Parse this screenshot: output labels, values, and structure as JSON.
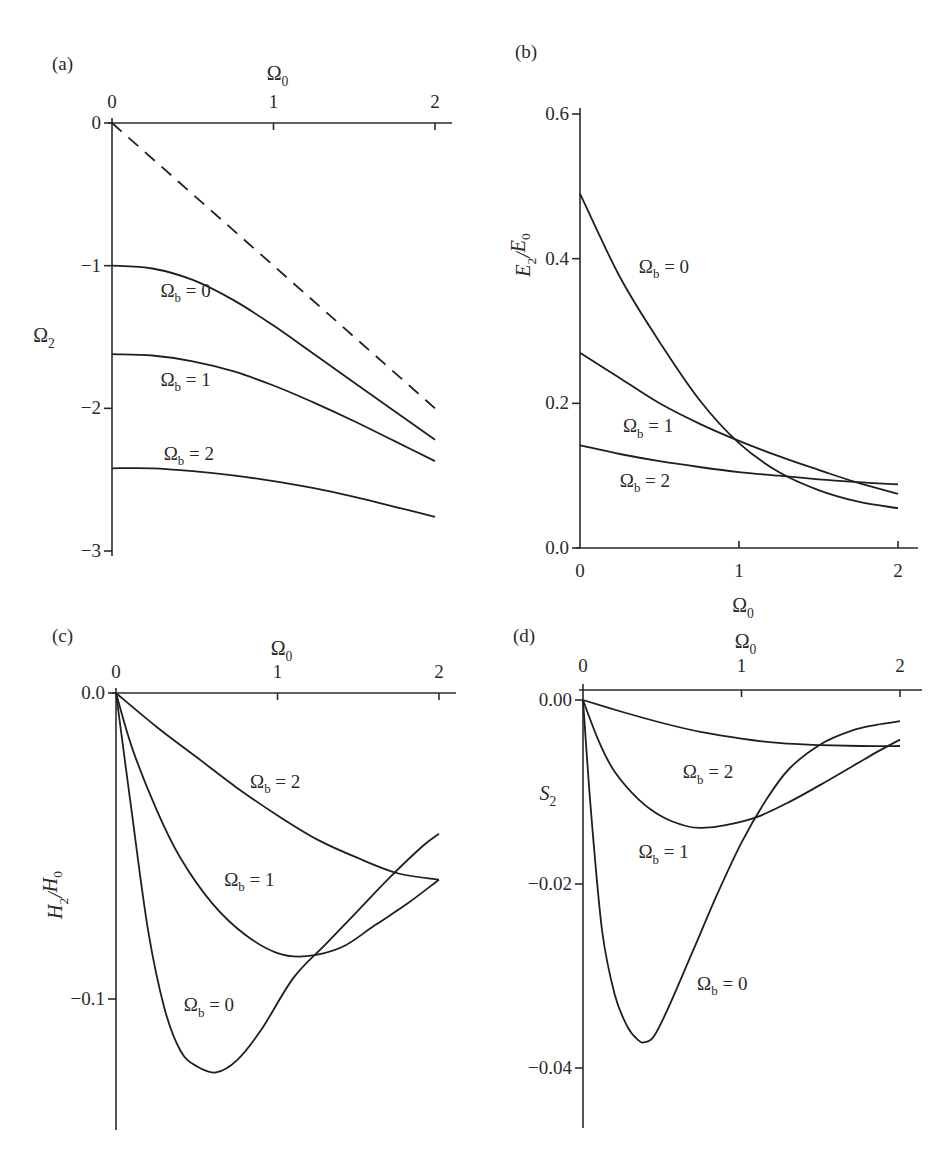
{
  "chart_data": [
    {
      "panel": "(a)",
      "type": "line",
      "xlabel": "Ω0",
      "xlabel_position": "top",
      "ylabel": "Ω2",
      "xlim": [
        0,
        2.1
      ],
      "ylim": [
        -3,
        0
      ],
      "xticks": [
        0,
        1,
        2
      ],
      "xtick_labels": [
        "0",
        "1",
        "2"
      ],
      "yticks": [
        0,
        -1,
        -2,
        -3
      ],
      "ytick_labels": [
        "0",
        "−1",
        "−2",
        "−3"
      ],
      "grid": false,
      "series": [
        {
          "name": "dashed reference",
          "style": "dashed",
          "x": [
            0,
            2
          ],
          "y": [
            0,
            -2
          ]
        },
        {
          "name": "Ωb = 0",
          "label": "Ωb = 0",
          "label_at": [
            0.3,
            -1.22
          ],
          "x": [
            0,
            0.25,
            0.5,
            0.75,
            1.0,
            1.25,
            1.5,
            1.75,
            2.0
          ],
          "y": [
            -1.0,
            -1.02,
            -1.1,
            -1.24,
            -1.42,
            -1.62,
            -1.82,
            -2.02,
            -2.22
          ]
        },
        {
          "name": "Ωb = 1",
          "label": "Ωb = 1",
          "label_at": [
            0.3,
            -1.84
          ],
          "x": [
            0,
            0.25,
            0.5,
            0.75,
            1.0,
            1.25,
            1.5,
            1.75,
            2.0
          ],
          "y": [
            -1.62,
            -1.63,
            -1.67,
            -1.74,
            -1.84,
            -1.96,
            -2.09,
            -2.23,
            -2.37
          ]
        },
        {
          "name": "Ωb = 2",
          "label": "Ωb = 2",
          "label_at": [
            0.32,
            -2.36
          ],
          "x": [
            0,
            0.25,
            0.5,
            0.75,
            1.0,
            1.25,
            1.5,
            1.75,
            2.0
          ],
          "y": [
            -2.42,
            -2.42,
            -2.44,
            -2.47,
            -2.51,
            -2.56,
            -2.62,
            -2.69,
            -2.76
          ]
        }
      ]
    },
    {
      "panel": "(b)",
      "type": "line",
      "xlabel": "Ω0",
      "xlabel_position": "bottom",
      "ylabel": "E2/E0",
      "xlim": [
        0,
        2.1
      ],
      "ylim": [
        0,
        0.6
      ],
      "xticks": [
        0,
        1,
        2
      ],
      "xtick_labels": [
        "0",
        "1",
        "2"
      ],
      "yticks": [
        0.0,
        0.2,
        0.4,
        0.6
      ],
      "ytick_labels": [
        "0.0",
        "0.2",
        "0.4",
        "0.6"
      ],
      "grid": false,
      "series": [
        {
          "name": "Ωb = 0",
          "label": "Ωb = 0",
          "label_at": [
            0.37,
            0.38
          ],
          "x": [
            0,
            0.25,
            0.5,
            0.75,
            1.0,
            1.25,
            1.5,
            1.75,
            2.0
          ],
          "y": [
            0.49,
            0.375,
            0.285,
            0.205,
            0.145,
            0.105,
            0.08,
            0.064,
            0.055
          ]
        },
        {
          "name": "Ωb = 1",
          "label": "Ωb = 1",
          "label_at": [
            0.27,
            0.16
          ],
          "x": [
            0,
            0.25,
            0.5,
            0.75,
            1.0,
            1.25,
            1.5,
            1.75,
            2.0
          ],
          "y": [
            0.27,
            0.235,
            0.2,
            0.172,
            0.148,
            0.127,
            0.108,
            0.09,
            0.075
          ]
        },
        {
          "name": "Ωb = 2",
          "label": "Ωb = 2",
          "label_at": [
            0.25,
            0.085
          ],
          "x": [
            0,
            0.25,
            0.5,
            0.75,
            1.0,
            1.25,
            1.5,
            1.75,
            2.0
          ],
          "y": [
            0.142,
            0.13,
            0.12,
            0.112,
            0.105,
            0.1,
            0.095,
            0.091,
            0.088
          ]
        }
      ]
    },
    {
      "panel": "(c)",
      "type": "line",
      "xlabel": "Ω0",
      "xlabel_position": "top",
      "ylabel": "H2/H0",
      "xlim": [
        0,
        2.1
      ],
      "ylim": [
        -0.142,
        0
      ],
      "xticks": [
        0,
        1,
        2
      ],
      "xtick_labels": [
        "0",
        "1",
        "2"
      ],
      "yticks": [
        0.0,
        -0.1
      ],
      "ytick_labels": [
        "0.0",
        "−0.1"
      ],
      "grid": false,
      "series": [
        {
          "name": "Ωb = 0",
          "label": "Ωb = 0",
          "label_at": [
            0.42,
            -0.104
          ],
          "x": [
            0,
            0.1,
            0.2,
            0.3,
            0.4,
            0.5,
            0.62,
            0.75,
            0.9,
            1.1,
            1.3,
            1.5,
            1.7,
            1.9,
            2.0
          ],
          "y": [
            0,
            -0.04,
            -0.078,
            -0.103,
            -0.117,
            -0.122,
            -0.124,
            -0.12,
            -0.11,
            -0.093,
            -0.082,
            -0.071,
            -0.06,
            -0.05,
            -0.046
          ]
        },
        {
          "name": "Ωb = 1",
          "label": "Ωb = 1",
          "label_at": [
            0.67,
            -0.063
          ],
          "x": [
            0,
            0.1,
            0.25,
            0.4,
            0.6,
            0.8,
            1.0,
            1.18,
            1.4,
            1.6,
            1.8,
            2.0
          ],
          "y": [
            0,
            -0.018,
            -0.038,
            -0.054,
            -0.069,
            -0.079,
            -0.085,
            -0.086,
            -0.083,
            -0.076,
            -0.069,
            -0.061
          ]
        },
        {
          "name": "Ωb = 2",
          "label": "Ωb = 2",
          "label_at": [
            0.83,
            -0.031
          ],
          "x": [
            0,
            0.25,
            0.5,
            0.75,
            1.0,
            1.25,
            1.5,
            1.75,
            2.0
          ],
          "y": [
            0,
            -0.011,
            -0.021,
            -0.031,
            -0.04,
            -0.048,
            -0.054,
            -0.059,
            -0.061
          ]
        }
      ]
    },
    {
      "panel": "(d)",
      "type": "line",
      "xlabel": "Ω0",
      "xlabel_position": "top",
      "ylabel": "S2",
      "xlim": [
        0,
        2.1
      ],
      "ylim": [
        -0.046,
        0.001
      ],
      "xticks": [
        0,
        1,
        2
      ],
      "xtick_labels": [
        "0",
        "1",
        "2"
      ],
      "yticks": [
        0.0,
        -0.02,
        -0.04
      ],
      "ytick_labels": [
        "0.00",
        "−0.02",
        "−0.04"
      ],
      "grid": false,
      "series": [
        {
          "name": "Ωb = 0",
          "label": "Ωb = 0",
          "label_at": [
            0.72,
            -0.0315
          ],
          "x": [
            0,
            0.05,
            0.12,
            0.2,
            0.28,
            0.35,
            0.39,
            0.45,
            0.55,
            0.7,
            0.85,
            1.0,
            1.15,
            1.3,
            1.5,
            1.7,
            1.85,
            2.0
          ],
          "y": [
            0,
            -0.012,
            -0.025,
            -0.032,
            -0.0355,
            -0.037,
            -0.0372,
            -0.0365,
            -0.033,
            -0.027,
            -0.021,
            -0.0155,
            -0.011,
            -0.0075,
            -0.0048,
            -0.0033,
            -0.0027,
            -0.0023
          ]
        },
        {
          "name": "Ωb = 1",
          "label": "Ωb = 1",
          "label_at": [
            0.35,
            -0.0172
          ],
          "x": [
            0,
            0.1,
            0.2,
            0.35,
            0.5,
            0.65,
            0.75,
            0.9,
            1.1,
            1.3,
            1.5,
            1.7,
            1.85,
            2.0
          ],
          "y": [
            0,
            -0.0045,
            -0.0078,
            -0.0108,
            -0.0127,
            -0.0137,
            -0.0139,
            -0.0136,
            -0.0127,
            -0.0111,
            -0.0092,
            -0.0072,
            -0.0057,
            -0.0043
          ]
        },
        {
          "name": "Ωb = 2",
          "label": "Ωb = 2",
          "label_at": [
            0.63,
            -0.0085
          ],
          "x": [
            0,
            0.25,
            0.5,
            0.75,
            1.0,
            1.25,
            1.5,
            1.75,
            2.0
          ],
          "y": [
            0,
            -0.0013,
            -0.0025,
            -0.0035,
            -0.0042,
            -0.0047,
            -0.0049,
            -0.005,
            -0.005
          ]
        }
      ]
    }
  ],
  "panels": [
    {
      "tag": "(a)"
    },
    {
      "tag": "(b)"
    },
    {
      "tag": "(c)"
    },
    {
      "tag": "(d)"
    }
  ]
}
